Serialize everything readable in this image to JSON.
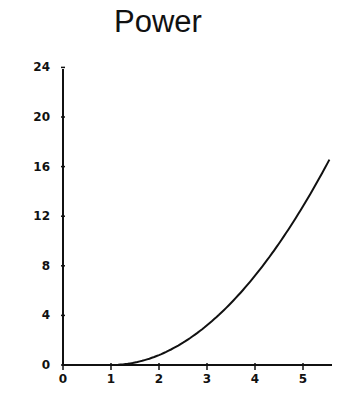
{
  "chart_data": {
    "type": "line",
    "title": "Power",
    "xlabel": "",
    "ylabel": "",
    "xlim": [
      0,
      5.6
    ],
    "ylim": [
      0,
      24
    ],
    "x_ticks": [
      0,
      1,
      2,
      3,
      4,
      5
    ],
    "y_ticks": [
      0,
      4,
      8,
      12,
      16,
      20,
      24
    ],
    "grid": false,
    "legend": null,
    "series": [
      {
        "name": "Power",
        "x": [
          0,
          1,
          1.5,
          2,
          2.5,
          3,
          3.5,
          4,
          4.5,
          5,
          5.5,
          5.56
        ],
        "y": [
          0,
          0,
          0.2,
          0.8,
          1.8,
          3.2,
          5.0,
          7.2,
          9.8,
          12.8,
          16.2,
          16.8
        ]
      }
    ]
  },
  "title": "Power",
  "axes": {
    "x_labels": [
      "0",
      "1",
      "2",
      "3",
      "4",
      "5"
    ],
    "y_labels": [
      "0",
      "4",
      "8",
      "12",
      "16",
      "20",
      "24"
    ]
  }
}
